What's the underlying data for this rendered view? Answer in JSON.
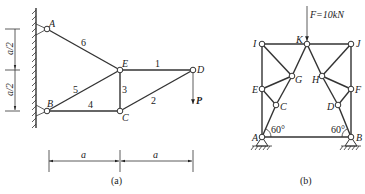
{
  "figure_a": {
    "caption": "(a)",
    "nodes": {
      "A": {
        "label": "A",
        "x": 47,
        "y": 29
      },
      "B": {
        "label": "B",
        "x": 47,
        "y": 111
      },
      "E": {
        "label": "E",
        "x": 120,
        "y": 70
      },
      "C": {
        "label": "C",
        "x": 120,
        "y": 111
      },
      "D": {
        "label": "D",
        "x": 193,
        "y": 70
      }
    },
    "members": [
      {
        "id": "1",
        "label": "1",
        "from": "E",
        "to": "D"
      },
      {
        "id": "2",
        "label": "2",
        "from": "C",
        "to": "D"
      },
      {
        "id": "3",
        "label": "3",
        "from": "E",
        "to": "C"
      },
      {
        "id": "4",
        "label": "4",
        "from": "B",
        "to": "C"
      },
      {
        "id": "5",
        "label": "5",
        "from": "B",
        "to": "E"
      },
      {
        "id": "6",
        "label": "6",
        "from": "A",
        "to": "E"
      }
    ],
    "load": {
      "label": "P",
      "node": "D",
      "direction": "down"
    },
    "dimensions": {
      "vertical_top": "a/2",
      "vertical_bottom": "a/2",
      "horizontal_left": "a",
      "horizontal_right": "a"
    }
  },
  "figure_b": {
    "caption": "(b)",
    "nodes": {
      "I": {
        "label": "I",
        "x": 262,
        "y": 44
      },
      "K": {
        "label": "K",
        "x": 307,
        "y": 44
      },
      "J": {
        "label": "J",
        "x": 351,
        "y": 44
      },
      "G": {
        "label": "G",
        "x": 292,
        "y": 76
      },
      "H": {
        "label": "H",
        "x": 322,
        "y": 76
      },
      "E": {
        "label": "E",
        "x": 262,
        "y": 89
      },
      "F": {
        "label": "F",
        "x": 351,
        "y": 89
      },
      "C": {
        "label": "C",
        "x": 276,
        "y": 105
      },
      "D": {
        "label": "D",
        "x": 338,
        "y": 105
      },
      "A": {
        "label": "A",
        "x": 262,
        "y": 137
      },
      "B": {
        "label": "B",
        "x": 351,
        "y": 137
      }
    },
    "load": {
      "label": "F=10kN",
      "node": "K",
      "direction": "down"
    },
    "angles": {
      "left": "60°",
      "right": "60°"
    }
  }
}
